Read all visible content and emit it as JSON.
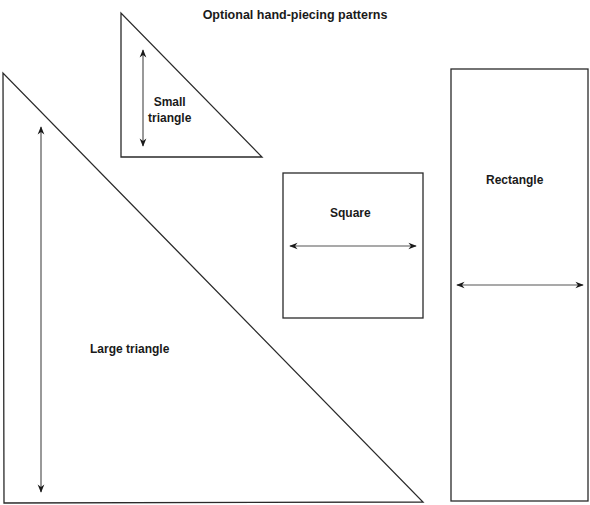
{
  "title": "Optional hand-piecing patterns",
  "colors": {
    "stroke": "#2a2a2a",
    "arrow": "#555555",
    "text": "#1a1a1a",
    "background": "#ffffff"
  },
  "shapes": [
    {
      "id": "small-triangle",
      "label": "Small\ntriangle",
      "type": "triangle",
      "points": [
        [
          121,
          13
        ],
        [
          121,
          157
        ],
        [
          262,
          157
        ]
      ],
      "arrow": {
        "orientation": "vertical",
        "x1": 143,
        "y1": 50,
        "x2": 143,
        "y2": 146
      },
      "label_pos": {
        "x": 148,
        "y": 94
      }
    },
    {
      "id": "large-triangle",
      "label": "Large triangle",
      "type": "triangle",
      "points": [
        [
          3,
          73
        ],
        [
          4,
          503
        ],
        [
          423,
          502
        ]
      ],
      "arrow": {
        "orientation": "vertical",
        "x1": 41,
        "y1": 127,
        "x2": 41,
        "y2": 492
      },
      "label_pos": {
        "x": 90,
        "y": 341
      }
    },
    {
      "id": "square",
      "label": "Square",
      "type": "rect",
      "x": 283,
      "y": 173,
      "width": 140,
      "height": 145,
      "arrow": {
        "orientation": "horizontal",
        "x1": 290,
        "y1": 246,
        "x2": 416,
        "y2": 246
      },
      "label_pos": {
        "x": 330,
        "y": 205
      }
    },
    {
      "id": "rectangle",
      "label": "Rectangle",
      "type": "rect",
      "x": 451,
      "y": 69,
      "width": 137,
      "height": 432,
      "arrow": {
        "orientation": "horizontal",
        "x1": 457,
        "y1": 285,
        "x2": 583,
        "y2": 285
      },
      "label_pos": {
        "x": 486,
        "y": 172
      }
    }
  ]
}
